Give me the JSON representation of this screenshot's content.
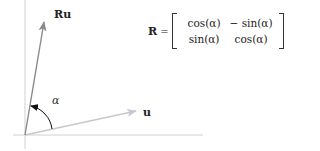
{
  "diagram": {
    "type": "rotation-of-vector",
    "vectors": [
      {
        "id": "u",
        "label": "u",
        "color": "#c8c8c8",
        "from": [
          25,
          135
        ],
        "to": [
          136,
          111
        ]
      },
      {
        "id": "Ru",
        "label": "Ru",
        "color": "#8a8a8a",
        "from": [
          25,
          135
        ],
        "to": [
          44,
          22
        ]
      }
    ],
    "angle": {
      "label": "α",
      "arc_color": "#222222"
    },
    "axes": {
      "color": "#cccccc"
    }
  },
  "labels": {
    "ru": "Ru",
    "u": "u",
    "alpha": "α"
  },
  "equation": {
    "lhs": "R",
    "equals": "=",
    "matrix": [
      [
        "cos(α)",
        "− sin(α)"
      ],
      [
        "sin(α)",
        "cos(α)"
      ]
    ]
  }
}
